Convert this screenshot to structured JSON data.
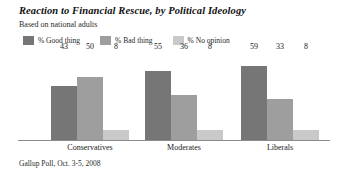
{
  "header": {
    "title": "Reaction to Financial Rescue, by Political Ideology",
    "subtitle": "Based on national adults"
  },
  "source": "Gallup Poll, Oct. 3-5, 2008",
  "colors": {
    "good": "#767676",
    "bad": "#9e9e9e",
    "no_opinion": "#c9c9c9",
    "baseline": "#8c8c8c",
    "background": "#ffffff"
  },
  "legend": {
    "items": [
      {
        "label": "% Good thing",
        "color": "#767676"
      },
      {
        "label": "% Bad thing",
        "color": "#9e9e9e"
      },
      {
        "label": "% No opinion",
        "color": "#c9c9c9"
      }
    ]
  },
  "chart_data": {
    "type": "bar",
    "title": "Reaction to Financial Rescue, by Political Ideology",
    "subtitle": "Based on national adults",
    "categories": [
      "Conservatives",
      "Moderates",
      "Liberals"
    ],
    "series": [
      {
        "name": "% Good thing",
        "color": "#767676",
        "values": [
          43,
          55,
          59
        ]
      },
      {
        "name": "% Bad thing",
        "color": "#9e9e9e",
        "values": [
          50,
          36,
          33
        ]
      },
      {
        "name": "% No opinion",
        "color": "#c9c9c9",
        "values": [
          8,
          8,
          8
        ]
      }
    ],
    "xlabel": "",
    "ylabel": "",
    "ylim": [
      0,
      70
    ],
    "grid": false,
    "legend_position": "top-left",
    "value_labels": true,
    "source": "Gallup Poll, Oct. 3-5, 2008"
  }
}
